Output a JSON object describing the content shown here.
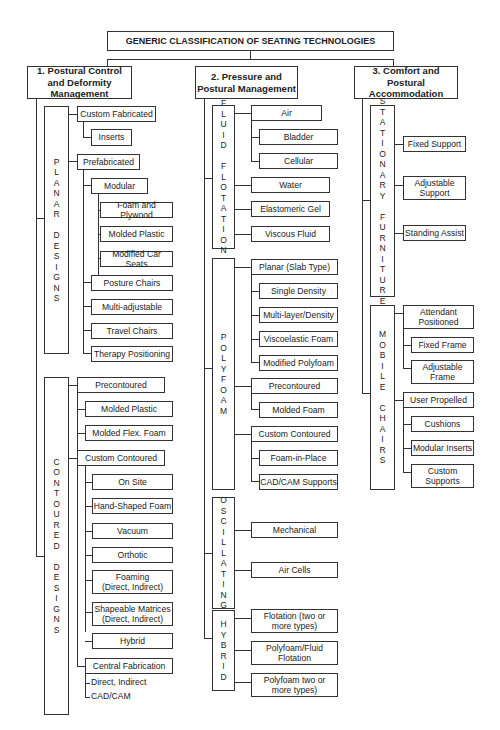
{
  "title": "GENERIC CLASSIFICATION OF SEATING TECHNOLOGIES",
  "categories": [
    {
      "label": "1. Postural Control and Deformity Management",
      "groups": [
        {
          "label": "PLANAR DESIGNS",
          "items": [
            "Custom Fabricated",
            "Inserts",
            "Prefabricated",
            "Modular",
            "Foam and Plywood",
            "Molded Plastic",
            "Modified Car Seats",
            "Posture Chairs",
            "Multi-adjustable",
            "Travel Chairs",
            "Therapy Positioning"
          ]
        },
        {
          "label": "CONTOURED DESIGNS",
          "items": [
            "Precontoured",
            "Molded Plastic",
            "Molded Flex. Foam",
            "Custom Contoured",
            "On Site",
            "Hand-Shaped Foam",
            "Vacuum",
            "Orthotic",
            "Foaming (Direct, Indirect)",
            "Shapeable Matrices (Direct, Indirect)",
            "Hybrid",
            "Central Fabrication",
            "Direct, Indirect",
            "CAD/CAM"
          ]
        }
      ]
    },
    {
      "label": "2. Pressure and Postural Management",
      "groups": [
        {
          "label": "FLUID FLOTATION",
          "items": [
            "Air",
            "Bladder",
            "Cellular",
            "Water",
            "Elastomeric Gel",
            "Viscous Fluid"
          ]
        },
        {
          "label": "POLYFOAM",
          "items": [
            "Planar (Slab Type)",
            "Single Density",
            "Multi-layer/Density",
            "Viscoelastic Foam",
            "Modified Polyfoam",
            "Precontoured",
            "Molded Foam",
            "Custom Contoured",
            "Foam-in-Place",
            "CAD/CAM Supports"
          ]
        },
        {
          "label": "OSCILLATING",
          "items": [
            "Mechanical",
            "Air Cells"
          ]
        },
        {
          "label": "HYBRID",
          "items": [
            "Flotation (two or more types)",
            "Polyfoam/Fluid Flotation",
            "Polyfoam two or more types)"
          ]
        }
      ]
    },
    {
      "label": "3. Comfort and Postural Accommodation",
      "groups": [
        {
          "label": "STATIONARY FURNITURE",
          "items": [
            "Fixed Support",
            "Adjustable Support",
            "Standing Assist"
          ]
        },
        {
          "label": "MOBILE CHAIRS",
          "items": [
            "Attendant Positioned",
            "Fixed Frame",
            "Adjustable Frame",
            "User Propelled",
            "Cushions",
            "Modular Inserts",
            "Custom Supports"
          ]
        }
      ]
    }
  ],
  "vertical_labels": {
    "planar": "P\nL\nA\nN\nA\nR\n \nD\nE\nS\nI\nG\nN\nS",
    "contoured": "C\nO\nN\nT\nO\nU\nR\nE\nD\n \nD\nE\nS\nI\nG\nN\nS",
    "fluid": "F\nL\nU\nI\nD\n \nF\nL\nO\nT\nA\nT\nI\nO\nN",
    "polyfoam": "P\nO\nL\nY\nF\nO\nA\nM",
    "oscillating": "O\nS\nC\nI\nL\nL\nA\nT\nI\nN\nG",
    "hybrid": "H\nY\nB\nR\nI\nD",
    "stationary": "S\nT\nA\nT\nI\nO\nN\nA\nR\nY\n \nF\nU\nR\nN\nI\nT\nU\nR\nE",
    "mobile": "M\nO\nB\nI\nL\nE\n \nC\nH\nA\nI\nR\nS"
  }
}
